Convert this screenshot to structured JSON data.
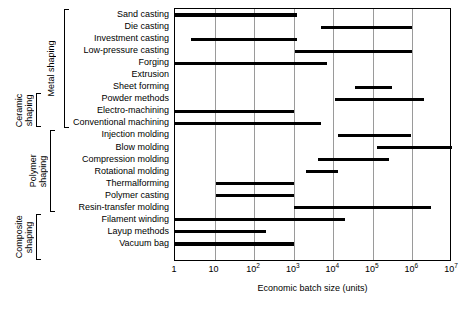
{
  "chart": {
    "xlabel": "Economic batch size (units)",
    "ylabel": "",
    "title": ""
  },
  "axis": {
    "ticks": [
      {
        "label": "1",
        "exp": "",
        "decade": 0
      },
      {
        "label": "10",
        "exp": "",
        "decade": 1
      },
      {
        "label": "10",
        "exp": "2",
        "decade": 2
      },
      {
        "label": "10",
        "exp": "3",
        "decade": 3
      },
      {
        "label": "10",
        "exp": "4",
        "decade": 4
      },
      {
        "label": "10",
        "exp": "5",
        "decade": 5
      },
      {
        "label": "10",
        "exp": "6",
        "decade": 6
      },
      {
        "label": "10",
        "exp": "7",
        "decade": 7
      }
    ]
  },
  "groups": [
    {
      "name": "metal-shaping",
      "label": "Metal shaping",
      "first_row": 0,
      "last_row": 9
    },
    {
      "name": "ceramic-shaping",
      "label": "Ceramic\nshaping",
      "first_row": 7,
      "last_row": 9
    },
    {
      "name": "polymer-shaping",
      "label": "Polymer\nshaping",
      "first_row": 10,
      "last_row": 16
    },
    {
      "name": "composite-shaping",
      "label": "Composite\nshaping",
      "first_row": 17,
      "last_row": 20
    }
  ],
  "chart_data": {
    "type": "bar",
    "orientation": "horizontal",
    "subtype": "range-bar",
    "title": "",
    "xlabel": "Economic batch size (units)",
    "ylabel": "",
    "xscale": "log",
    "xlim": [
      1,
      10000000
    ],
    "xticks": [
      1,
      10,
      100,
      1000,
      10000,
      100000,
      1000000,
      10000000
    ],
    "xticklabels": [
      "1",
      "10",
      "10^2",
      "10^3",
      "10^4",
      "10^5",
      "10^6",
      "10^7"
    ],
    "grid": "vertical",
    "legend": "none",
    "categories": [
      "Sand casting",
      "Die casting",
      "Investment casting",
      "Low-pressure casting",
      "Forging",
      "Extrusion",
      "Sheet forming",
      "Powder methods",
      "Electro-machining",
      "Conventional machining",
      "Injection molding",
      "Blow molding",
      "Compression molding",
      "Rotational molding",
      "Thermalforming",
      "Polymer casting",
      "Resin-transfer molding",
      "Filament winding",
      "Layup methods",
      "Vacuum bag"
    ],
    "ranges": [
      {
        "category": "Sand casting",
        "group": "Metal shaping",
        "low": 1,
        "high": 1200
      },
      {
        "category": "Die casting",
        "group": "Metal shaping",
        "low": 5000,
        "high": 1000000
      },
      {
        "category": "Investment casting",
        "group": "Metal shaping",
        "low": 2.5,
        "high": 1200
      },
      {
        "category": "Low-pressure casting",
        "group": "Metal shaping",
        "low": 1100,
        "high": 1000000
      },
      {
        "category": "Forging",
        "group": "Metal shaping",
        "low": 1,
        "high": 7000
      },
      {
        "category": "Extrusion",
        "group": "Metal shaping",
        "low": null,
        "high": null
      },
      {
        "category": "Sheet forming",
        "group": "Metal shaping",
        "low": 35000,
        "high": 300000
      },
      {
        "category": "Powder methods",
        "group": "Ceramic shaping",
        "low": 11000,
        "high": 2000000
      },
      {
        "category": "Electro-machining",
        "group": "Ceramic shaping",
        "low": 1,
        "high": 1000
      },
      {
        "category": "Conventional machining",
        "group": "Ceramic shaping",
        "low": 1,
        "high": 5000
      },
      {
        "category": "Injection molding",
        "group": "Polymer shaping",
        "low": 13000,
        "high": 900000
      },
      {
        "category": "Blow molding",
        "group": "Polymer shaping",
        "low": 130000,
        "high": 10000000
      },
      {
        "category": "Compression molding",
        "group": "Polymer shaping",
        "low": 4000,
        "high": 250000
      },
      {
        "category": "Rotational molding",
        "group": "Polymer shaping",
        "low": 2000,
        "high": 13000
      },
      {
        "category": "Thermalforming",
        "group": "Polymer shaping",
        "low": 11,
        "high": 1000
      },
      {
        "category": "Polymer casting",
        "group": "Polymer shaping",
        "low": 11,
        "high": 1000
      },
      {
        "category": "Resin-transfer molding",
        "group": "Composite shaping",
        "low": 1000,
        "high": 3000000
      },
      {
        "category": "Filament winding",
        "group": "Composite shaping",
        "low": 1,
        "high": 20000
      },
      {
        "category": "Layup methods",
        "group": "Composite shaping",
        "low": 1,
        "high": 200
      },
      {
        "category": "Vacuum bag",
        "group": "Composite shaping",
        "low": 1,
        "high": 1000
      }
    ]
  }
}
